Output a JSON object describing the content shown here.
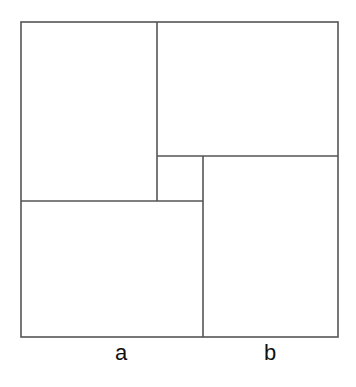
{
  "diagram": {
    "line_color": "#555555",
    "labels": {
      "a": "a",
      "b": "b"
    }
  }
}
